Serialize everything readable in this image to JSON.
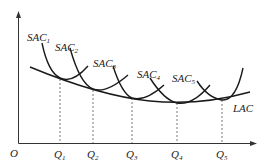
{
  "diagram": {
    "type": "economics-cost-curves",
    "axes": {
      "origin_label": "O",
      "x_axis": "quantity",
      "y_axis": "cost"
    },
    "curves": [
      {
        "id": "SAC1",
        "label": "SAC",
        "subscript": "1"
      },
      {
        "id": "SAC2",
        "label": "SAC",
        "subscript": "2"
      },
      {
        "id": "SAC3",
        "label": "SAC",
        "subscript": "3"
      },
      {
        "id": "SAC4",
        "label": "SAC",
        "subscript": "4"
      },
      {
        "id": "SAC5",
        "label": "SAC",
        "subscript": "5"
      },
      {
        "id": "LAC",
        "label": "LAC"
      }
    ],
    "x_ticks": [
      {
        "label": "Q",
        "subscript": "1"
      },
      {
        "label": "Q",
        "subscript": "2"
      },
      {
        "label": "Q",
        "subscript": "3"
      },
      {
        "label": "Q",
        "subscript": "4"
      },
      {
        "label": "Q",
        "subscript": "5"
      }
    ],
    "colors": {
      "line": "#1a1a1a",
      "background": "#ffffff"
    }
  }
}
